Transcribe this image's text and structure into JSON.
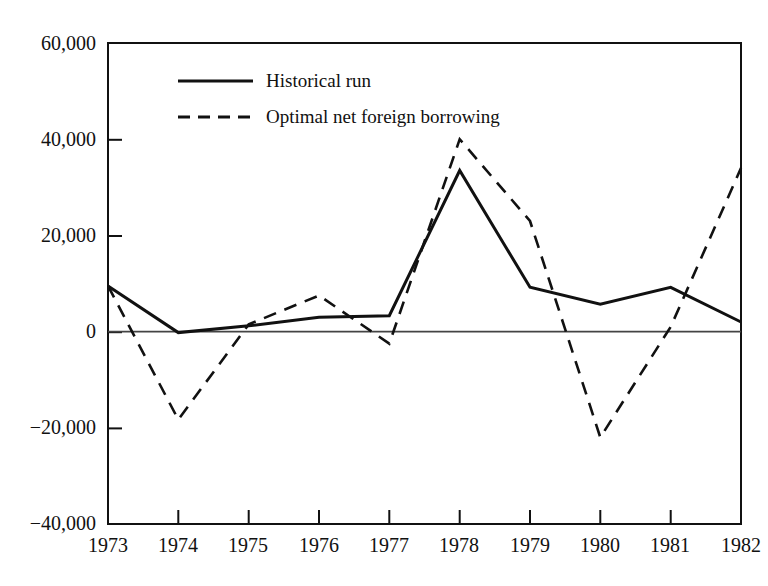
{
  "figure": {
    "title_fragment": "",
    "background": "#ffffff",
    "line_color": "#111111"
  },
  "legend": {
    "position": "top-left-inside",
    "entries": [
      {
        "label": "Historical run",
        "style": "solid",
        "swatch": "solid-line-swatch"
      },
      {
        "label": "Optimal net foreign borrowing",
        "style": "dashed",
        "swatch": "dashed-line-swatch"
      }
    ]
  },
  "chart_data": {
    "type": "line",
    "title": "",
    "xlabel": "",
    "ylabel": "",
    "categories": [
      "1973",
      "1974",
      "1975",
      "1976",
      "1977",
      "1978",
      "1979",
      "1980",
      "1981",
      "1982"
    ],
    "x": [
      1973,
      1974,
      1975,
      1976,
      1977,
      1978,
      1979,
      1980,
      1981,
      1982
    ],
    "xlim": [
      1973,
      1982
    ],
    "ylim": [
      -40000,
      60000
    ],
    "yticks": [
      -40000,
      -20000,
      0,
      20000,
      40000,
      60000
    ],
    "ytick_labels": [
      "−40,000",
      "−20,000",
      "0",
      "20,000",
      "40,000",
      "60,000"
    ],
    "xtick_labels": [
      "1973",
      "1974",
      "1975",
      "1976",
      "1977",
      "1978",
      "1979",
      "1980",
      "1981",
      "1982"
    ],
    "grid": false,
    "zero_line": true,
    "legend_position": "upper left",
    "series": [
      {
        "name": "Historical run",
        "style": "solid",
        "color": "#111111",
        "values": [
          9500,
          -200,
          1200,
          3000,
          3300,
          33500,
          9200,
          5700,
          9200,
          2000
        ]
      },
      {
        "name": "Optimal net foreign borrowing",
        "style": "dashed",
        "color": "#111111",
        "values": [
          9500,
          -18300,
          1500,
          7500,
          -2500,
          40000,
          23000,
          -22000,
          1000,
          34000
        ]
      }
    ]
  }
}
